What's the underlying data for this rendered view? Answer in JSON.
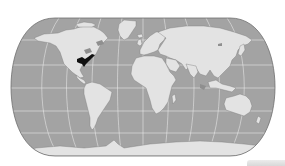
{
  "map": {
    "projection": "pseudocylindrical world map (rounded-pole, Eckert-like)",
    "style": "grayscale",
    "colors": {
      "background": "#ffffff",
      "ocean": "#a3a3a3",
      "land": "#e3e3e3",
      "graticule": "#f2f2f2",
      "outline": "#6e6e6e",
      "highlight": "#111111",
      "lakes": "#8f8f8f"
    },
    "graticule": {
      "latitude_lines_y": [
        40,
        65,
        88,
        111,
        133
      ],
      "central_meridian_x": 143
    },
    "highlighted_region": {
      "label": "Eastern United States (Mississippi / Ohio valley region)",
      "color": "#111111"
    },
    "continents": [
      "North America",
      "Greenland",
      "South America",
      "Europe",
      "Africa",
      "Asia",
      "Australia",
      "Antarctica"
    ]
  },
  "corner_bar": {
    "color": "#dcdcdc"
  }
}
